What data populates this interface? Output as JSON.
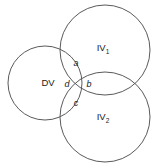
{
  "diagram": {
    "type": "venn-3-circle",
    "background_color": "#ffffff",
    "stroke_color": "#5a5a5a",
    "text_color": "#1a1a1a",
    "width": 160,
    "height": 168,
    "circles": [
      {
        "id": "dv",
        "label": "DV",
        "cx": 45,
        "cy": 83,
        "r": 37
      },
      {
        "id": "iv1",
        "label": "IV",
        "subscript": "1",
        "cx": 105,
        "cy": 50,
        "r": 45
      },
      {
        "id": "iv2",
        "label": "IV",
        "subscript": "2",
        "cx": 105,
        "cy": 117,
        "r": 45
      }
    ],
    "set_labels": {
      "dv": "DV",
      "iv1_base": "IV",
      "iv1_sub": "1",
      "iv2_base": "IV",
      "iv2_sub": "2"
    },
    "overlap_labels": {
      "a": "a",
      "b": "b",
      "c": "c",
      "d": "d"
    }
  }
}
